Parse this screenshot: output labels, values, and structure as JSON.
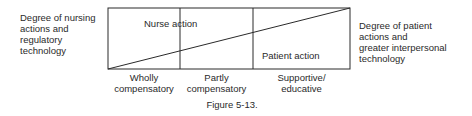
{
  "figure": {
    "caption": "Figure 5-13.",
    "left_axis_label": [
      "Degree of nursing",
      "actions and",
      "regulatory",
      "technology"
    ],
    "right_axis_label": [
      "Degree of patient",
      "actions and",
      "greater interpersonal",
      "technology"
    ],
    "regions": {
      "upper": "Nurse action",
      "lower": "Patient action"
    },
    "modes": [
      {
        "line1": "Wholly",
        "line2": "compensatory"
      },
      {
        "line1": "Partly",
        "line2": "compensatory"
      },
      {
        "line1": "Supportive/",
        "line2": "educative"
      }
    ],
    "colors": {
      "line": "#2a2a2a",
      "text": "#2a2a2a",
      "background": "#ffffff"
    }
  }
}
